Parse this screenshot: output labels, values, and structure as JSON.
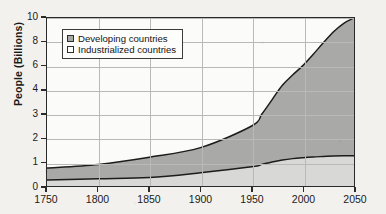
{
  "chart_data": {
    "type": "area",
    "title": "",
    "subtitle": "",
    "xlabel": "",
    "ylabel": "People (Billions)",
    "xlim": [
      1750,
      2050
    ],
    "ylim": [
      0,
      10
    ],
    "grid": true,
    "stacked": true,
    "legend_position": "top-left",
    "x_ticks": [
      "1750",
      "1800",
      "1850",
      "1900",
      "1950",
      "2000",
      "2050"
    ],
    "y_ticks": [
      "0",
      "1",
      "2",
      "3",
      "4",
      "6",
      "8",
      "10"
    ],
    "x": [
      1750,
      1800,
      1850,
      1900,
      1950,
      1960,
      1970,
      1980,
      1990,
      2000,
      2010,
      2020,
      2030,
      2040,
      2050
    ],
    "series": [
      {
        "name": "Industrialized countries",
        "color": "#d8d8d6",
        "values": [
          0.25,
          0.3,
          0.35,
          0.55,
          0.8,
          0.9,
          1.0,
          1.08,
          1.14,
          1.18,
          1.21,
          1.23,
          1.25,
          1.26,
          1.26
        ]
      },
      {
        "name": "Developing countries",
        "color": "#a9a9a7",
        "values": [
          0.5,
          0.6,
          0.85,
          1.05,
          1.7,
          2.1,
          2.6,
          3.3,
          4.1,
          4.85,
          5.75,
          6.7,
          7.6,
          8.3,
          8.74
        ]
      }
    ],
    "total_line": [
      0.75,
      0.9,
      1.2,
      1.6,
      2.5,
      3.0,
      3.6,
      4.4,
      5.25,
      6.03,
      6.96,
      7.93,
      8.85,
      9.56,
      10.0
    ],
    "annotations": []
  },
  "legend": {
    "items": [
      {
        "label": "Developing countries",
        "swatch": "#a9a9a7"
      },
      {
        "label": "Industrialized countries",
        "swatch": "#ffffff"
      }
    ]
  },
  "colors": {
    "developing_fill": "#a9a9a7",
    "industrialized_fill": "#d8d8d6",
    "curve_stroke": "#1c1c1c",
    "axis": "#2a2a2a",
    "grid": "#b9b9b9",
    "plot_bg": "#fbfbfa",
    "page_bg": "#f2f1ee"
  }
}
